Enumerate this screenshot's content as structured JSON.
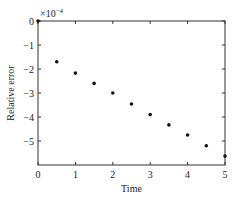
{
  "chart_data": {
    "type": "scatter",
    "title": "",
    "xlabel": "Time",
    "ylabel": "Relative error",
    "y_multiplier": "×10",
    "y_multiplier_exp": "−4",
    "xlim": [
      0,
      5
    ],
    "ylim": [
      -6,
      0
    ],
    "x_ticks": [
      0,
      1,
      2,
      3,
      4,
      5
    ],
    "x_tick_labels": [
      "0",
      "1",
      "2",
      "3",
      "4",
      "5"
    ],
    "y_ticks": [
      0,
      -1,
      -2,
      -3,
      -4,
      -5
    ],
    "y_tick_labels": [
      "0",
      "−1",
      "−2",
      "−3",
      "−4",
      "−5"
    ],
    "grid": false,
    "legend": null,
    "series": [
      {
        "name": "Relative error",
        "marker": "dot",
        "color": "#111111",
        "x": [
          0,
          0.5,
          1.0,
          1.5,
          2.0,
          2.5,
          3.0,
          3.5,
          4.0,
          4.5,
          5.0
        ],
        "y": [
          0,
          -1.7,
          -2.17,
          -2.6,
          -3.0,
          -3.46,
          -3.9,
          -4.33,
          -4.75,
          -5.2,
          -5.63
        ]
      }
    ]
  }
}
